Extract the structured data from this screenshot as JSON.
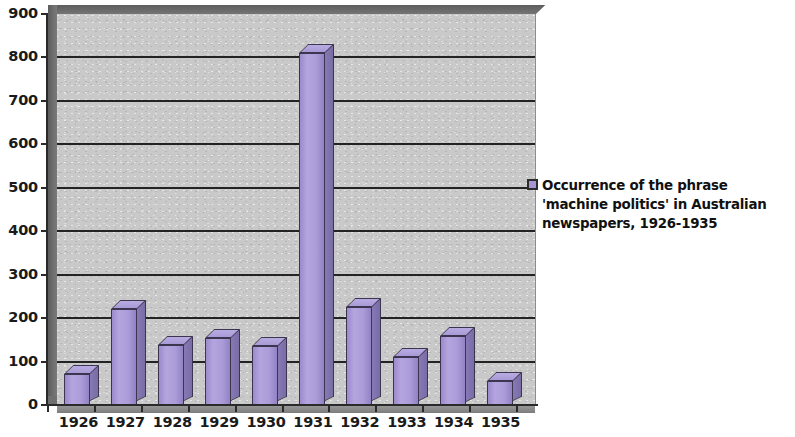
{
  "chart_data": {
    "type": "bar",
    "title": "",
    "subtitle": "",
    "xlabel": "",
    "ylabel": "",
    "categories": [
      "1926",
      "1927",
      "1928",
      "1929",
      "1930",
      "1931",
      "1932",
      "1933",
      "1934",
      "1935"
    ],
    "values": [
      72,
      220,
      138,
      155,
      135,
      810,
      225,
      110,
      160,
      55
    ],
    "series": [
      {
        "name": "Occurrence of the phrase 'machine politics' in Australian newspapers, 1926-1935",
        "values": [
          72,
          220,
          138,
          155,
          135,
          810,
          225,
          110,
          160,
          55
        ]
      }
    ],
    "ylim": [
      0,
      900
    ],
    "ytick_step": 100,
    "ytick_labels": [
      "900",
      "800",
      "700",
      "600",
      "500",
      "400",
      "300",
      "200",
      "100",
      "0"
    ],
    "ytick_values": [
      900,
      800,
      700,
      600,
      500,
      400,
      300,
      200,
      100,
      0
    ],
    "grid": true,
    "grid_axis": "y",
    "legend_position": "right",
    "style": "3d-column",
    "colors": {
      "bar_face": "#a89ad8",
      "bar_side": "#7f72ab",
      "bar_top": "#b4a6de",
      "bar_outline": "#3b3550",
      "plot_background": "#c9c9c9",
      "gridline": "#232323",
      "axis": "#2a2a2a",
      "text": "#1a1a1a",
      "wall": "#6f6f6f"
    }
  },
  "legend": {
    "entries": [
      {
        "label": "Occurrence of the phrase 'machine politics' in Australian newspapers, 1926-1935",
        "color": "#a595d4"
      }
    ]
  }
}
